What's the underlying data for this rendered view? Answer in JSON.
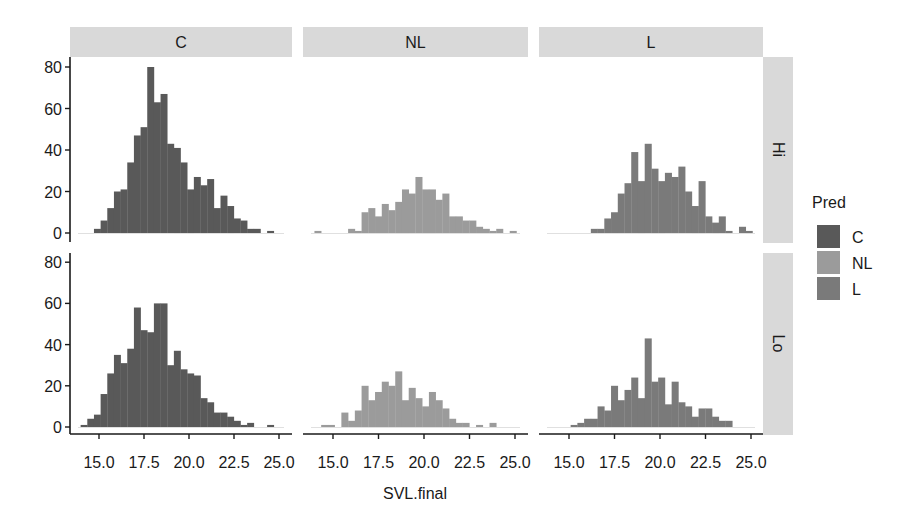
{
  "chart_data": {
    "type": "bar",
    "subtype": "faceted histogram",
    "xlabel": "SVL.final",
    "ylabel": "",
    "x_ticks": [
      15.0,
      17.5,
      20.0,
      22.5,
      25.0
    ],
    "x_tick_labels": [
      "15.0",
      "17.5",
      "20.0",
      "22.5",
      "25.0"
    ],
    "y_ticks": [
      0,
      20,
      40,
      60,
      80
    ],
    "y_tick_labels": [
      "0",
      "20",
      "40",
      "60",
      "80"
    ],
    "xlim": [
      13.39,
      25.72
    ],
    "ylim": [
      0,
      82
    ],
    "bins": {
      "start": 13.61,
      "width": 0.37,
      "count": 32
    },
    "column_facets": [
      "C",
      "NL",
      "L"
    ],
    "row_facets": [
      "Hi",
      "Lo"
    ],
    "legend": {
      "title": "Pred",
      "position": "right",
      "entries": [
        {
          "label": "C",
          "color": "#595959"
        },
        {
          "label": "NL",
          "color": "#9b9b9b"
        },
        {
          "label": "L",
          "color": "#7a7a7a"
        }
      ]
    },
    "panels": [
      {
        "row": "Hi",
        "col": "C",
        "fill": "#595959",
        "first_bin": 3,
        "counts": [
          2,
          6,
          12,
          20,
          21,
          34,
          47,
          51,
          80,
          63,
          67,
          43,
          41,
          34,
          21,
          27,
          23,
          26,
          12,
          18,
          13,
          7,
          6,
          2,
          2,
          0,
          1
        ]
      },
      {
        "row": "Hi",
        "col": "NL",
        "fill": "#9b9b9b",
        "first_bin": 1,
        "counts": [
          1,
          0,
          0,
          0,
          0,
          2,
          1,
          10,
          12,
          8,
          14,
          11,
          15,
          21,
          19,
          27,
          21,
          21,
          16,
          19,
          8,
          8,
          6,
          6,
          3,
          2,
          1,
          2,
          0,
          1
        ]
      },
      {
        "row": "Hi",
        "col": "L",
        "fill": "#7a7a7a",
        "first_bin": 7,
        "counts": [
          2,
          2,
          7,
          10,
          19,
          24,
          39,
          25,
          43,
          31,
          25,
          29,
          27,
          32,
          20,
          13,
          25,
          8,
          5,
          8,
          1,
          0,
          3,
          1
        ]
      },
      {
        "row": "Lo",
        "col": "C",
        "fill": "#595959",
        "first_bin": 1,
        "counts": [
          1,
          4,
          6,
          16,
          26,
          35,
          31,
          38,
          58,
          47,
          46,
          60,
          60,
          30,
          37,
          28,
          26,
          25,
          14,
          12,
          7,
          7,
          5,
          3,
          1,
          2,
          0,
          0,
          1
        ]
      },
      {
        "row": "Lo",
        "col": "NL",
        "fill": "#9b9b9b",
        "first_bin": 2,
        "counts": [
          1,
          1,
          0,
          7,
          3,
          8,
          20,
          13,
          17,
          22,
          20,
          27,
          13,
          19,
          14,
          10,
          17,
          13,
          9,
          4,
          2,
          2,
          0,
          1,
          0,
          2
        ]
      },
      {
        "row": "Lo",
        "col": "L",
        "fill": "#7a7a7a",
        "first_bin": 4,
        "counts": [
          1,
          2,
          4,
          4,
          10,
          8,
          20,
          13,
          18,
          24,
          14,
          43,
          22,
          24,
          11,
          22,
          12,
          10,
          5,
          9,
          9,
          5,
          3,
          3
        ]
      }
    ]
  },
  "layout": {
    "strip_bg": "#d9d9d9",
    "axis_color": "#1a1a1a",
    "baseline_color": "#e0e0e0"
  }
}
